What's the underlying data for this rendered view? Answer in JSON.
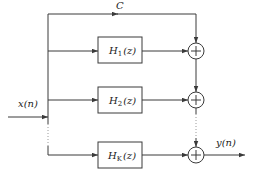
{
  "diagram": {
    "type": "parallel filter bank block diagram",
    "input": {
      "label": "x(n)"
    },
    "output": {
      "label": "y(n)"
    },
    "direct_path": {
      "label": "C"
    },
    "blocks": [
      {
        "name": "H",
        "sub": "1",
        "arg": "(z)"
      },
      {
        "name": "H",
        "sub": "2",
        "arg": "(z)"
      },
      {
        "name": "H",
        "sub": "K",
        "arg": "(z)"
      }
    ],
    "adders": [
      {
        "symbol": "+"
      },
      {
        "symbol": "+"
      },
      {
        "symbol": "+"
      }
    ],
    "colors": {
      "line": "#3a3a3a",
      "dotted": "#9a9a9a",
      "background": "#ffffff"
    }
  }
}
